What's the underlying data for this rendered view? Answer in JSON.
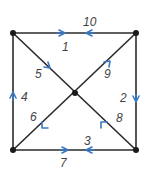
{
  "diagram": {
    "type": "directed-graph",
    "colors": {
      "edge": "#2a2a2a",
      "arrow": "#3a78c0",
      "vertex": "#1a1a1a",
      "label": "#444444"
    },
    "vertices": [
      {
        "id": "TL",
        "x": 13,
        "y": 33
      },
      {
        "id": "TR",
        "x": 136,
        "y": 33
      },
      {
        "id": "BL",
        "x": 13,
        "y": 150
      },
      {
        "id": "BR",
        "x": 136,
        "y": 150
      },
      {
        "id": "C",
        "x": 75,
        "y": 93
      }
    ],
    "edges": [
      {
        "label": "1",
        "from": "TL",
        "to": "TR",
        "arrow_dir": "right"
      },
      {
        "label": "10",
        "from": "TR",
        "to": "TL",
        "arrow_dir": "left"
      },
      {
        "label": "2",
        "from": "TR",
        "to": "BR",
        "arrow_dir": "down"
      },
      {
        "label": "3",
        "from": "BR",
        "to": "BL",
        "arrow_dir": "left"
      },
      {
        "label": "7",
        "from": "BL",
        "to": "BR",
        "arrow_dir": "right"
      },
      {
        "label": "4",
        "from": "BL",
        "to": "TL",
        "arrow_dir": "up"
      },
      {
        "label": "5",
        "from": "TL",
        "to": "C",
        "arrow_dir": "down-right"
      },
      {
        "label": "9",
        "from": "C",
        "to": "TR",
        "arrow_dir": "up-right"
      },
      {
        "label": "6",
        "from": "C",
        "to": "BL",
        "arrow_dir": "down-left"
      },
      {
        "label": "8",
        "from": "BR",
        "to": "C",
        "arrow_dir": "up-left"
      }
    ],
    "labels": {
      "e1": "1",
      "e2": "2",
      "e3": "3",
      "e4": "4",
      "e5": "5",
      "e6": "6",
      "e7": "7",
      "e8": "8",
      "e9": "9",
      "e10": "10"
    }
  }
}
